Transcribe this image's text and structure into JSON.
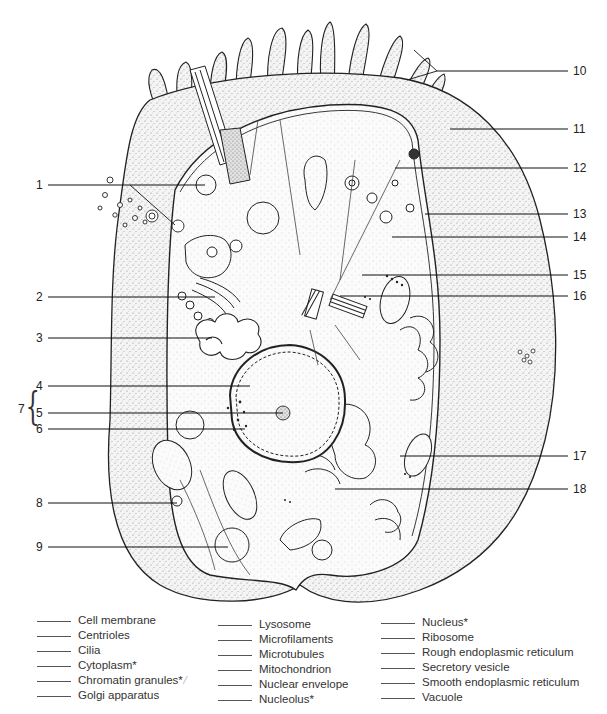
{
  "diagram": {
    "callouts_left": [
      {
        "num": "1",
        "y": 185
      },
      {
        "num": "2",
        "y": 297
      },
      {
        "num": "3",
        "y": 338
      },
      {
        "num": "4",
        "y": 386
      },
      {
        "num": "5",
        "y": 413
      },
      {
        "num": "6",
        "y": 429
      },
      {
        "num": "8",
        "y": 503
      },
      {
        "num": "9",
        "y": 547
      }
    ],
    "group_label": {
      "num": "7",
      "spans": [
        "4",
        "5",
        "6"
      ]
    },
    "callouts_right": [
      {
        "num": "10",
        "y": 71
      },
      {
        "num": "11",
        "y": 129
      },
      {
        "num": "12",
        "y": 168
      },
      {
        "num": "13",
        "y": 214
      },
      {
        "num": "14",
        "y": 237
      },
      {
        "num": "15",
        "y": 275
      },
      {
        "num": "16",
        "y": 296
      },
      {
        "num": "17",
        "y": 456
      },
      {
        "num": "18",
        "y": 489
      }
    ]
  },
  "legend": {
    "columns": [
      [
        "Cell membrane",
        "Centrioles",
        "Cilia",
        "Cytoplasm*",
        "Chromatin granules*",
        "Golgi apparatus"
      ],
      [
        "Lysosome",
        "Microfilaments",
        "Microtubules",
        "Mitochondrion",
        "Nuclear envelope",
        "Nucleolus*"
      ],
      [
        "Nucleus*",
        "Ribosome",
        "Rough endoplasmic reticulum",
        "Secretory vesicle",
        "Smooth endoplasmic reticulum",
        "Vacuole"
      ]
    ],
    "checkmark_after": "Chromatin granules*"
  }
}
